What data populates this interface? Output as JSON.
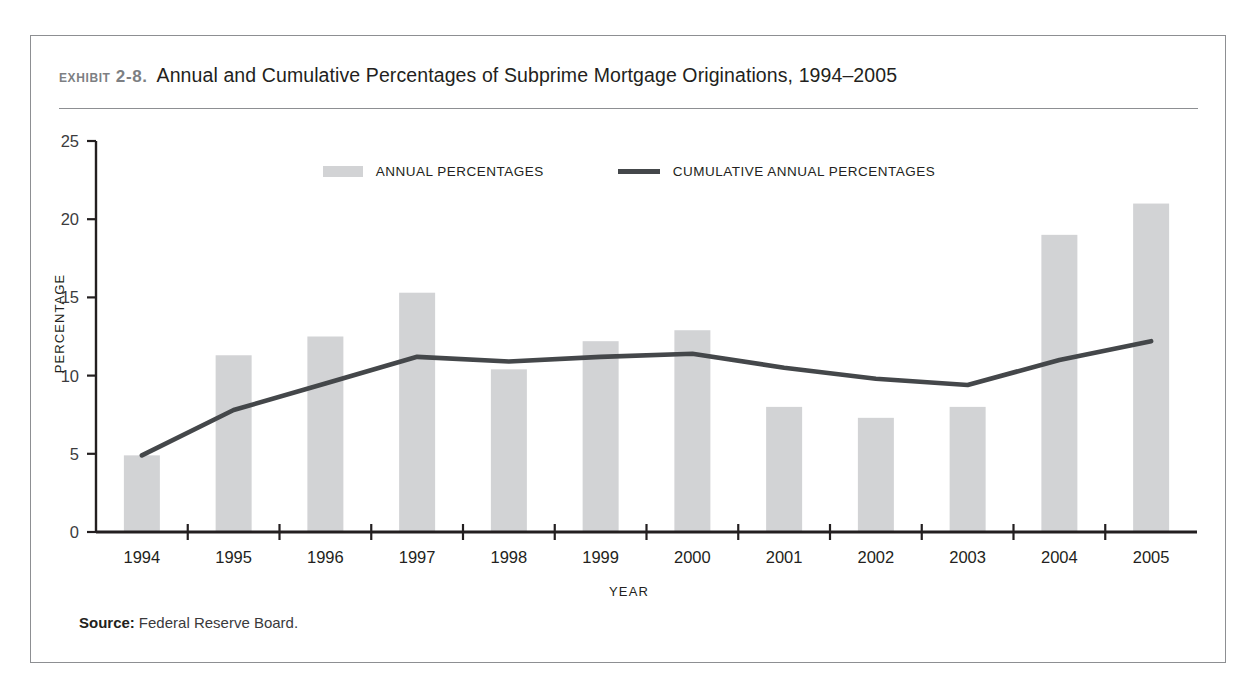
{
  "exhibit": {
    "label": "Exhibit 2-8.",
    "title": "Annual and Cumulative Percentages of Subprime Mortgage Originations, 1994–2005"
  },
  "legend": {
    "items": [
      {
        "label": "ANNUAL PERCENTAGES",
        "marker": "bar-swatch",
        "color": "#d2d3d5"
      },
      {
        "label": "CUMULATIVE ANNUAL PERCENTAGES",
        "marker": "line-swatch",
        "color": "#44474a"
      }
    ]
  },
  "source": {
    "label": "Source:",
    "text": "Federal Reserve Board."
  },
  "chart_data": {
    "type": "bar",
    "title": "Annual and Cumulative Percentages of Subprime Mortgage Originations, 1994–2005",
    "xlabel": "YEAR",
    "ylabel": "PERCENTAGE",
    "categories": [
      "1994",
      "1995",
      "1996",
      "1997",
      "1998",
      "1999",
      "2000",
      "2001",
      "2002",
      "2003",
      "2004",
      "2005"
    ],
    "ylim": [
      0,
      25
    ],
    "yticks": [
      0,
      5,
      10,
      15,
      20,
      25
    ],
    "ytick_labels": [
      "0",
      "5",
      "10",
      "15",
      "20",
      "25"
    ],
    "grid": false,
    "legend_position": "top-center",
    "series": [
      {
        "name": "ANNUAL PERCENTAGES",
        "type": "bar",
        "color": "#d2d3d5",
        "values": [
          4.9,
          11.3,
          12.5,
          15.3,
          10.4,
          12.2,
          12.9,
          8.0,
          7.3,
          8.0,
          19.0,
          21.0
        ]
      },
      {
        "name": "CUMULATIVE ANNUAL PERCENTAGES",
        "type": "line",
        "color": "#44474a",
        "values": [
          4.9,
          7.8,
          9.5,
          11.2,
          10.9,
          11.2,
          11.4,
          10.5,
          9.8,
          9.4,
          11.0,
          12.2
        ]
      }
    ]
  }
}
